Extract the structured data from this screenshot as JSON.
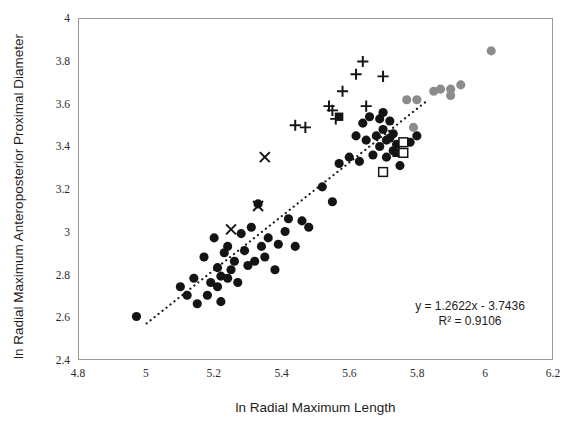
{
  "chart_data": {
    "type": "scatter",
    "title": "",
    "xlabel": "ln Radial Maximum Length",
    "ylabel": "ln Radial Maximum Anteroposterior Proximal Diameter",
    "xlim": [
      4.8,
      6.2
    ],
    "ylim": [
      2.4,
      4.0
    ],
    "xticks": [
      "4.8",
      "5",
      "5.2",
      "5.4",
      "5.6",
      "5.8",
      "6",
      "6.2"
    ],
    "xtick_values": [
      4.8,
      5.0,
      5.2,
      5.4,
      5.6,
      5.8,
      6.0,
      6.2
    ],
    "yticks": [
      "2.4",
      "2.6",
      "2.8",
      "3",
      "3.2",
      "3.4",
      "3.6",
      "3.8",
      "4"
    ],
    "ytick_values": [
      2.4,
      2.6,
      2.8,
      3.0,
      3.2,
      3.4,
      3.6,
      3.8,
      4.0
    ],
    "grid": false,
    "legend": "none",
    "annotations": [
      {
        "name": "regression-equation",
        "text": "y = 1.2622x - 3.7436"
      },
      {
        "name": "r-squared",
        "text": "R² = 0.9106"
      }
    ],
    "trendline": {
      "name": "dotted-regression-line",
      "style": "dotted",
      "color": "#1a1a1a",
      "slope": 1.2622,
      "intercept": -3.7436,
      "x_start": 5.0,
      "x_end": 5.83
    },
    "series": [
      {
        "name": "black-filled-circles",
        "marker": "circle",
        "color": "#141414",
        "filled": true,
        "points": [
          [
            4.97,
            2.6
          ],
          [
            5.1,
            2.74
          ],
          [
            5.12,
            2.7
          ],
          [
            5.14,
            2.78
          ],
          [
            5.15,
            2.66
          ],
          [
            5.17,
            2.88
          ],
          [
            5.18,
            2.7
          ],
          [
            5.19,
            2.76
          ],
          [
            5.2,
            2.97
          ],
          [
            5.21,
            2.74
          ],
          [
            5.21,
            2.83
          ],
          [
            5.22,
            2.79
          ],
          [
            5.22,
            2.67
          ],
          [
            5.23,
            2.9
          ],
          [
            5.24,
            2.78
          ],
          [
            5.24,
            2.93
          ],
          [
            5.25,
            2.82
          ],
          [
            5.26,
            2.86
          ],
          [
            5.27,
            2.76
          ],
          [
            5.28,
            2.99
          ],
          [
            5.29,
            2.91
          ],
          [
            5.3,
            2.84
          ],
          [
            5.31,
            3.02
          ],
          [
            5.32,
            2.86
          ],
          [
            5.33,
            3.13
          ],
          [
            5.34,
            2.93
          ],
          [
            5.35,
            2.88
          ],
          [
            5.36,
            2.97
          ],
          [
            5.38,
            2.82
          ],
          [
            5.39,
            2.94
          ],
          [
            5.41,
            3.0
          ],
          [
            5.42,
            3.06
          ],
          [
            5.44,
            2.93
          ],
          [
            5.46,
            3.05
          ],
          [
            5.48,
            3.02
          ],
          [
            5.52,
            3.21
          ],
          [
            5.55,
            3.14
          ],
          [
            5.57,
            3.32
          ],
          [
            5.6,
            3.35
          ],
          [
            5.62,
            3.45
          ],
          [
            5.63,
            3.33
          ],
          [
            5.64,
            3.51
          ],
          [
            5.65,
            3.43
          ],
          [
            5.66,
            3.54
          ],
          [
            5.67,
            3.36
          ],
          [
            5.68,
            3.45
          ],
          [
            5.69,
            3.53
          ],
          [
            5.69,
            3.4
          ],
          [
            5.7,
            3.48
          ],
          [
            5.7,
            3.56
          ],
          [
            5.71,
            3.43
          ],
          [
            5.71,
            3.35
          ],
          [
            5.72,
            3.44
          ],
          [
            5.72,
            3.52
          ],
          [
            5.73,
            3.38
          ],
          [
            5.73,
            3.46
          ],
          [
            5.74,
            3.41
          ],
          [
            5.75,
            3.31
          ],
          [
            5.78,
            3.42
          ],
          [
            5.8,
            3.45
          ]
        ]
      },
      {
        "name": "gray-filled-circles",
        "marker": "circle",
        "color": "#8c8c8c",
        "filled": true,
        "points": [
          [
            5.77,
            3.62
          ],
          [
            5.8,
            3.62
          ],
          [
            5.79,
            3.49
          ],
          [
            5.85,
            3.66
          ],
          [
            5.87,
            3.67
          ],
          [
            5.9,
            3.67
          ],
          [
            5.93,
            3.69
          ],
          [
            5.9,
            3.64
          ],
          [
            6.02,
            3.85
          ]
        ]
      },
      {
        "name": "plus-markers",
        "marker": "plus",
        "color": "#141414",
        "filled": false,
        "points": [
          [
            5.44,
            3.5
          ],
          [
            5.47,
            3.49
          ],
          [
            5.54,
            3.59
          ],
          [
            5.55,
            3.57
          ],
          [
            5.56,
            3.53
          ],
          [
            5.58,
            3.66
          ],
          [
            5.62,
            3.74
          ],
          [
            5.64,
            3.8
          ],
          [
            5.65,
            3.59
          ],
          [
            5.7,
            3.73
          ]
        ]
      },
      {
        "name": "x-markers",
        "marker": "x",
        "color": "#141414",
        "filled": false,
        "points": [
          [
            5.35,
            3.35
          ],
          [
            5.33,
            3.12
          ],
          [
            5.25,
            3.01
          ]
        ]
      },
      {
        "name": "black-filled-squares",
        "marker": "square",
        "color": "#141414",
        "filled": true,
        "points": [
          [
            5.57,
            3.54
          ],
          [
            5.74,
            3.37
          ]
        ]
      },
      {
        "name": "open-squares",
        "marker": "square",
        "color": "#141414",
        "filled": false,
        "points": [
          [
            5.76,
            3.42
          ],
          [
            5.76,
            3.37
          ],
          [
            5.7,
            3.28
          ]
        ]
      }
    ]
  }
}
